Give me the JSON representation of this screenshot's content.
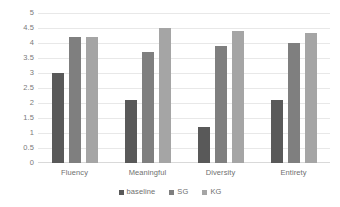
{
  "chart_data": {
    "type": "bar",
    "title": "",
    "subtitle": "",
    "xlabel": "",
    "ylabel": "",
    "ylim": [
      0,
      5
    ],
    "ytick_step": 0.5,
    "yticks": [
      "5",
      "4.5",
      "4",
      "3.5",
      "3",
      "2.5",
      "2",
      "1.5",
      "1",
      "0.5",
      "0"
    ],
    "categories": [
      "Fluency",
      "Meaningful",
      "Diversity",
      "Entirety"
    ],
    "series": [
      {
        "name": "baseline",
        "color": "#595959",
        "values": [
          3.0,
          2.1,
          1.2,
          2.1
        ]
      },
      {
        "name": "SG",
        "color": "#7f7f7f",
        "values": [
          4.2,
          3.7,
          3.9,
          4.0
        ]
      },
      {
        "name": "KG",
        "color": "#a5a5a5",
        "values": [
          4.2,
          4.5,
          4.4,
          4.35
        ]
      }
    ],
    "grid": true,
    "grid_color": "#e8e8e8",
    "legend_position": "bottom",
    "background": "#ffffff"
  }
}
